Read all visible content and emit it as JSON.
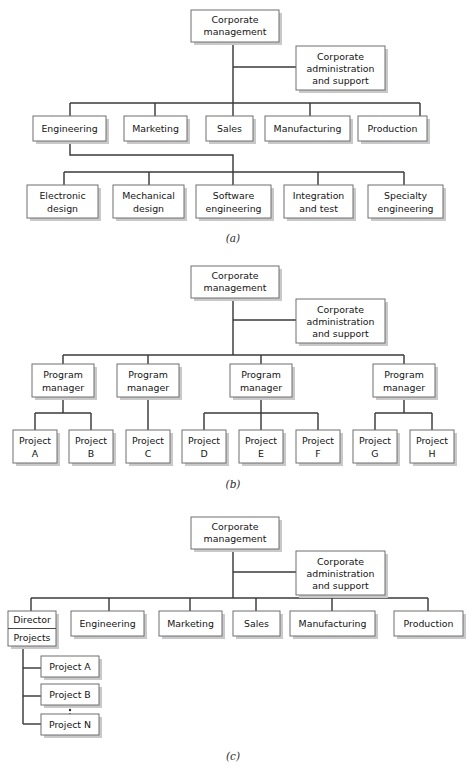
{
  "figure": {
    "panels": [
      {
        "id": "a",
        "caption": "(a)",
        "description": "Functional organization",
        "nodes": {
          "root": "Corporate\nmanagement",
          "root_line1": "Corporate",
          "root_line2": "management",
          "staff_line1": "Corporate",
          "staff_line2": "administration",
          "staff_line3": "and support",
          "divisions": [
            "Engineering",
            "Marketing",
            "Sales",
            "Manufacturing",
            "Production"
          ],
          "engineering_subunits": [
            {
              "line1": "Electronic",
              "line2": "design"
            },
            {
              "line1": "Mechanical",
              "line2": "design"
            },
            {
              "line1": "Software",
              "line2": "engineering"
            },
            {
              "line1": "Integration",
              "line2": "and test"
            },
            {
              "line1": "Specialty",
              "line2": "engineering"
            }
          ]
        }
      },
      {
        "id": "b",
        "caption": "(b)",
        "description": "Project organization",
        "nodes": {
          "root_line1": "Corporate",
          "root_line2": "management",
          "staff_line1": "Corporate",
          "staff_line2": "administration",
          "staff_line3": "and support",
          "managers": [
            {
              "line1": "Program",
              "line2": "manager"
            },
            {
              "line1": "Program",
              "line2": "manager"
            },
            {
              "line1": "Program",
              "line2": "manager"
            },
            {
              "line1": "Program",
              "line2": "manager"
            }
          ],
          "projects": [
            {
              "line1": "Project",
              "line2": "A"
            },
            {
              "line1": "Project",
              "line2": "B"
            },
            {
              "line1": "Project",
              "line2": "C"
            },
            {
              "line1": "Project",
              "line2": "D"
            },
            {
              "line1": "Project",
              "line2": "E"
            },
            {
              "line1": "Project",
              "line2": "F"
            },
            {
              "line1": "Project",
              "line2": "G"
            },
            {
              "line1": "Project",
              "line2": "H"
            }
          ]
        }
      },
      {
        "id": "c",
        "caption": "(c)",
        "description": "Matrix organization",
        "nodes": {
          "root_line1": "Corporate",
          "root_line2": "management",
          "staff_line1": "Corporate",
          "staff_line2": "administration",
          "staff_line3": "and support",
          "director_line1": "Director",
          "director_line2": "Projects",
          "divisions": [
            "Engineering",
            "Marketing",
            "Sales",
            "Manufacturing",
            "Production"
          ],
          "projects": [
            "Project A",
            "Project B",
            "Project N"
          ],
          "ellipsis": "⋮"
        }
      }
    ]
  },
  "style": {
    "box_stroke": "#6f6f6f",
    "box_fill": "#ffffff",
    "line_color": "#3a3a3a",
    "shadow_color": "#c9c9c9",
    "text_color": "#141414",
    "background": "#ffffff"
  }
}
